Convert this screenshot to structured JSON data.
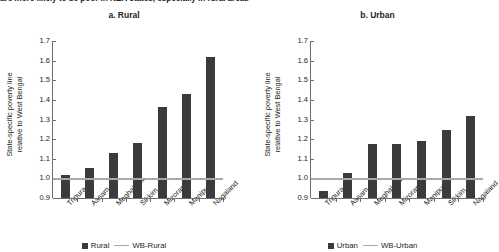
{
  "headline": "are more likely to be poor in NER states, especially in rural areas",
  "panels": [
    {
      "title": "a. Rural",
      "ylabel_line1": "State-specific poverty line",
      "ylabel_line2": "relative to West Bengal",
      "legend": {
        "bar_label": "Rural",
        "line_label": "WB-Rural"
      }
    },
    {
      "title": "b. Urban",
      "ylabel_line1": "State-specific poverty line",
      "ylabel_line2": "relative to West Bengal",
      "legend": {
        "bar_label": "Urban",
        "line_label": "WB-Urban"
      }
    }
  ],
  "colors": {
    "bar": "#3b3b3d",
    "reference_line": "#a7a9ac",
    "axis": "#6d6e71",
    "text": "#231f20",
    "background": "#ffffff"
  },
  "chart_data": [
    {
      "type": "bar",
      "title": "a. Rural",
      "xlabel": "",
      "ylabel": "State-specific poverty line relative to West Bengal",
      "ylim": [
        0.9,
        1.7
      ],
      "yticks": [
        0.9,
        1.0,
        1.1,
        1.2,
        1.3,
        1.4,
        1.5,
        1.6,
        1.7
      ],
      "grid": false,
      "legend_position": "bottom",
      "categories": [
        "Tripura",
        "Assam",
        "Meghalaya",
        "Sikkim",
        "Mizoram",
        "Manipur",
        "Nagaland"
      ],
      "series": [
        {
          "name": "Rural",
          "values": [
            1.015,
            1.055,
            1.13,
            1.18,
            1.365,
            1.43,
            1.62
          ]
        }
      ],
      "reference_line": {
        "name": "WB-Rural",
        "value": 1.0
      }
    },
    {
      "type": "bar",
      "title": "b. Urban",
      "xlabel": "",
      "ylabel": "State-specific poverty line relative to West Bengal",
      "ylim": [
        0.9,
        1.7
      ],
      "yticks": [
        0.9,
        1.0,
        1.1,
        1.2,
        1.3,
        1.4,
        1.5,
        1.6,
        1.7
      ],
      "grid": false,
      "legend_position": "bottom",
      "categories": [
        "Tripura",
        "Assam",
        "Meghalaya",
        "Mizoram",
        "Manipur",
        "Sikkim",
        "Nagaland"
      ],
      "series": [
        {
          "name": "Urban",
          "values": [
            0.935,
            1.025,
            1.175,
            1.175,
            1.19,
            1.247,
            1.32
          ]
        }
      ],
      "reference_line": {
        "name": "WB-Urban",
        "value": 1.0
      }
    }
  ]
}
